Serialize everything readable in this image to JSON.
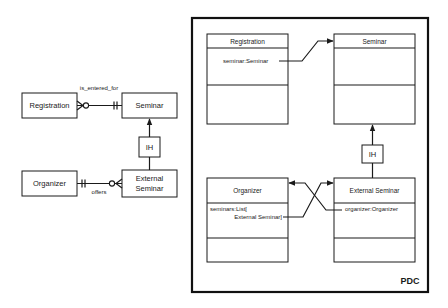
{
  "er_diagram": {
    "entities": [
      {
        "id": "registration",
        "label": "Registration"
      },
      {
        "id": "seminar",
        "label": "Seminar"
      },
      {
        "id": "organizer",
        "label": "Organizer"
      },
      {
        "id": "external_seminar",
        "label_line1": "External",
        "label_line2": "Seminar"
      }
    ],
    "relationships": [
      {
        "from": "registration",
        "to": "seminar",
        "label": "is_entered_for",
        "from_cardinality": "zero-or-many",
        "to_cardinality": "exactly-one"
      },
      {
        "from": "organizer",
        "to": "external_seminar",
        "label": "offers",
        "from_cardinality": "exactly-one",
        "to_cardinality": "zero-or-many"
      }
    ],
    "inheritance": {
      "label": "IH",
      "child": "external_seminar",
      "parent": "seminar"
    }
  },
  "pdc_diagram": {
    "frame_label": "PDC",
    "classes": [
      {
        "id": "registration",
        "name": "Registration",
        "attributes": [
          "seminar:Seminar"
        ]
      },
      {
        "id": "seminar",
        "name": "Seminar",
        "attributes": []
      },
      {
        "id": "organizer",
        "name": "Organizer",
        "attributes_line1": "seminars:List[",
        "attributes_line2": "External Seminar]"
      },
      {
        "id": "external_seminar",
        "name": "External Seminar",
        "attributes": [
          "organizer:Organizer"
        ]
      }
    ],
    "inheritance": {
      "label": "IH"
    }
  }
}
